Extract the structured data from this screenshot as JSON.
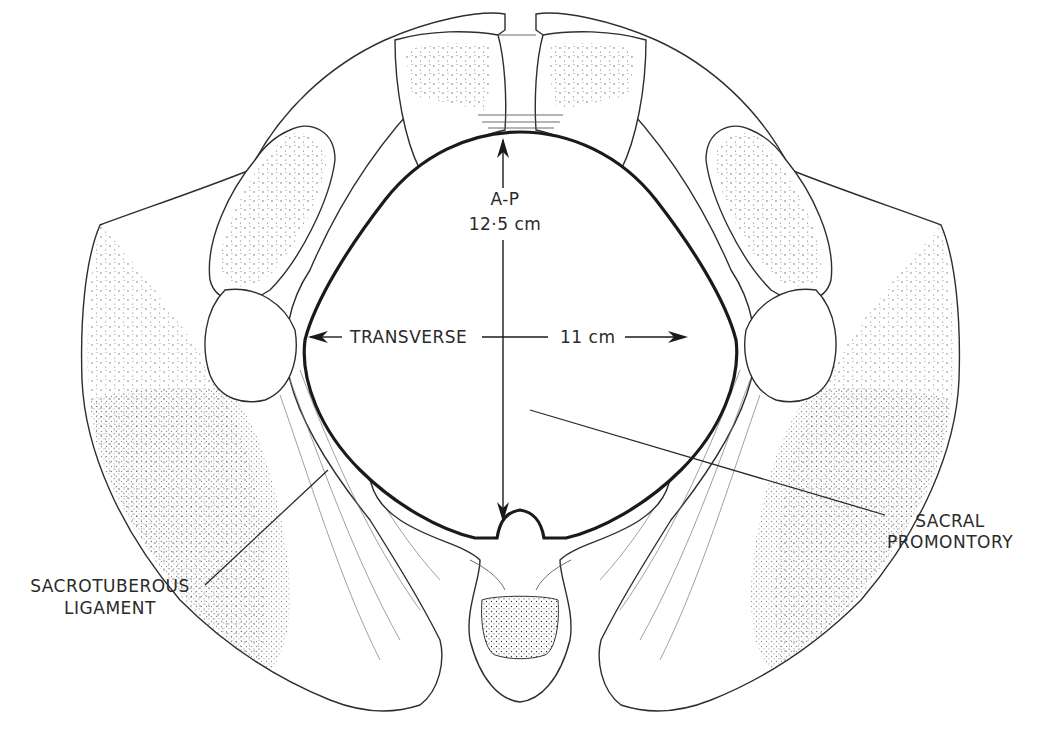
{
  "figure": {
    "labels": {
      "ap": "A-P",
      "ap_value": "12·5 cm",
      "transverse": "TRANSVERSE",
      "transverse_value": "11 cm",
      "sacral_promontory_line1": "SACRAL",
      "sacral_promontory_line2": "PROMONTORY",
      "sacrotuberous_line1": "SACROTUBEROUS",
      "sacrotuberous_line2": "LIGAMENT"
    },
    "measurements": [
      {
        "name": "A-P",
        "value": "12·5 cm"
      },
      {
        "name": "TRANSVERSE",
        "value": "11 cm"
      }
    ],
    "colors": {
      "ink": "#1a1a1a",
      "paper": "#ffffff"
    }
  }
}
